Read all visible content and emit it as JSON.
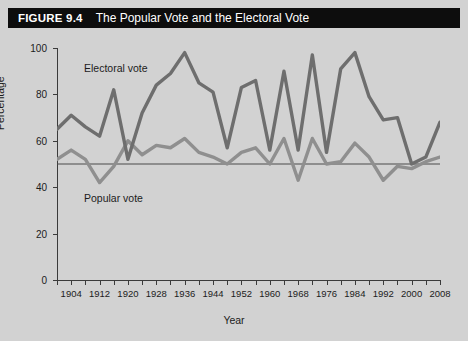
{
  "figure": {
    "number": "FIGURE 9.4",
    "title": "The Popular Vote and the Electoral Vote"
  },
  "colors": {
    "background": "#d2d2d2",
    "title_bar": "#0d0d0d",
    "title_text": "#ffffff",
    "electoral_line": "#6e6e6e",
    "popular_line": "#8f8f8f",
    "axis": "#3b3b3b",
    "reference_line": "#4a4a4a"
  },
  "labels": {
    "electoral": "Electoral vote",
    "popular": "Popular vote"
  },
  "chart_data": {
    "type": "line",
    "title": "The Popular Vote and the Electoral Vote",
    "xlabel": "Year",
    "ylabel": "Percentage",
    "xlim": [
      1900,
      2008
    ],
    "ylim": [
      0,
      100
    ],
    "grid": false,
    "legend": "inline-annotations",
    "y_ticks": [
      0,
      20,
      40,
      60,
      80,
      100
    ],
    "x_ticks": [
      1900,
      1904,
      1908,
      1912,
      1916,
      1920,
      1924,
      1928,
      1932,
      1936,
      1940,
      1944,
      1948,
      1952,
      1956,
      1960,
      1964,
      1968,
      1972,
      1976,
      1980,
      1984,
      1988,
      1992,
      1996,
      2000,
      2004,
      2008
    ],
    "x_tick_labels": [
      "",
      "1904",
      "",
      "1912",
      "",
      "1920",
      "",
      "1928",
      "",
      "1936",
      "",
      "1944",
      "",
      "1952",
      "",
      "1960",
      "",
      "1968",
      "",
      "1976",
      "",
      "1984",
      "",
      "1992",
      "",
      "2000",
      "",
      "2008"
    ],
    "reference_line": {
      "y": 50,
      "label": "50%"
    },
    "x": [
      1900,
      1904,
      1908,
      1912,
      1916,
      1920,
      1924,
      1928,
      1932,
      1936,
      1940,
      1944,
      1948,
      1952,
      1956,
      1960,
      1964,
      1968,
      1972,
      1976,
      1980,
      1984,
      1988,
      1992,
      1996,
      2000,
      2004,
      2008
    ],
    "series": [
      {
        "name": "Electoral vote",
        "values": [
          65,
          71,
          66,
          62,
          82,
          52,
          72,
          84,
          89,
          98,
          85,
          81,
          57,
          83,
          86,
          56,
          90,
          56,
          97,
          55,
          91,
          98,
          79,
          69,
          70,
          50,
          53,
          68
        ]
      },
      {
        "name": "Popular vote",
        "values": [
          52,
          56,
          52,
          42,
          49,
          60,
          54,
          58,
          57,
          61,
          55,
          53,
          50,
          55,
          57,
          50,
          61,
          43,
          61,
          50,
          51,
          59,
          53,
          43,
          49,
          48,
          51,
          53
        ]
      }
    ]
  }
}
